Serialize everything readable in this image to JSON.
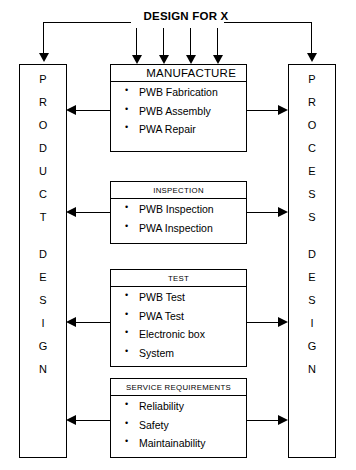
{
  "diagram": {
    "title": "DESIGN FOR X",
    "left_pillar": {
      "name": "PRODUCT DESIGN",
      "letters": [
        "P",
        "R",
        "O",
        "D",
        "U",
        "C",
        "T",
        "",
        "D",
        "E",
        "S",
        "I",
        "G",
        "N"
      ]
    },
    "right_pillar": {
      "name": "PROCESS DESIGN",
      "letters": [
        "P",
        "R",
        "O",
        "C",
        "E",
        "S",
        "S",
        "",
        "D",
        "E",
        "S",
        "I",
        "G",
        "N"
      ]
    },
    "stages": [
      {
        "header": "MANUFACTURE",
        "items": [
          "PWB Fabrication",
          "PWB Assembly",
          "PWA Repair"
        ]
      },
      {
        "header": "INSPECTION",
        "items": [
          "PWB Inspection",
          "PWA Inspection"
        ]
      },
      {
        "header": "TEST",
        "items": [
          "PWB Test",
          "PWA Test",
          "Electronic box",
          "System"
        ]
      },
      {
        "header": "SERVICE REQUIREMENTS",
        "items": [
          "Reliability",
          "Safety",
          "Maintainability"
        ]
      }
    ],
    "colors": {
      "line": "#000000",
      "background": "#ffffff"
    }
  }
}
